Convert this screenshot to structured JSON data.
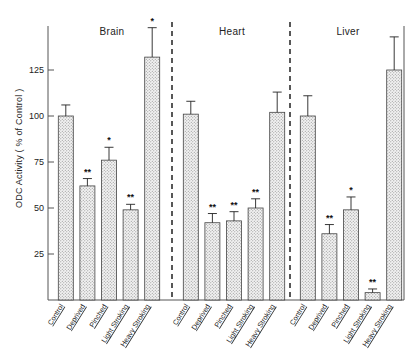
{
  "chart_data": {
    "type": "bar",
    "title": "",
    "xlabel": "",
    "ylabel": "ODC Activity ( % of Control )",
    "ylim": [
      0,
      150
    ],
    "yticks": [
      25,
      50,
      75,
      100,
      125
    ],
    "ytick_labels": [
      "25",
      "50",
      "75",
      "100",
      "125"
    ],
    "grid": false,
    "legend": "none",
    "categories": [
      "Control",
      "Deprived",
      "Pinched",
      "Light Stroking",
      "Heavy Stroking"
    ],
    "panels": [
      {
        "name": "Brain",
        "values": [
          100,
          62,
          76,
          49,
          132
        ],
        "errors": [
          6,
          4,
          7,
          3,
          16
        ],
        "significance": [
          "",
          "**",
          "*",
          "**",
          "*"
        ]
      },
      {
        "name": "Heart",
        "values": [
          101,
          42,
          43,
          50,
          102
        ],
        "errors": [
          7,
          5,
          5,
          5,
          11
        ],
        "significance": [
          "",
          "**",
          "**",
          "**",
          ""
        ]
      },
      {
        "name": "Liver",
        "values": [
          100,
          36,
          49,
          4,
          125
        ],
        "errors": [
          11,
          5,
          7,
          2,
          18
        ],
        "significance": [
          "",
          "**",
          "*",
          "**",
          ""
        ]
      }
    ],
    "series": [
      {
        "name": "Brain",
        "values": [
          100,
          62,
          76,
          49,
          132
        ]
      },
      {
        "name": "Heart",
        "values": [
          101,
          42,
          43,
          50,
          102
        ]
      },
      {
        "name": "Liver",
        "values": [
          100,
          36,
          49,
          4,
          125
        ]
      }
    ],
    "annotations": {
      "significance_markers": [
        "*",
        "**"
      ],
      "separators": 2
    },
    "colors": {
      "bar_fill": "#e8e8e8",
      "bar_stroke": "#444444",
      "axis": "#555555",
      "text": "#222222",
      "separator": "#111111"
    }
  }
}
